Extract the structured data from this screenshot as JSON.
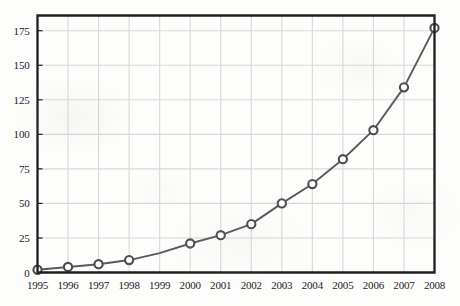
{
  "chart_data": {
    "type": "line",
    "title": "",
    "subtitle": "",
    "xlabel": "",
    "ylabel": "",
    "x": [
      1995,
      1996,
      1997,
      1998,
      1999,
      2000,
      2001,
      2002,
      2003,
      2004,
      2005,
      2006,
      2007,
      2008
    ],
    "categories": [
      "1995",
      "1996",
      "1997",
      "1998",
      "1999",
      "2000",
      "2001",
      "2002",
      "2003",
      "2004",
      "2005",
      "2006",
      "2007",
      "2008"
    ],
    "values": [
      2,
      4,
      6,
      9,
      14,
      21,
      27,
      35,
      50,
      64,
      82,
      103,
      134,
      177
    ],
    "markers_shown": [
      true,
      true,
      true,
      true,
      false,
      true,
      true,
      true,
      true,
      true,
      true,
      true,
      true,
      true
    ],
    "series": [
      {
        "name": "series-1",
        "values": [
          2,
          4,
          6,
          9,
          14,
          21,
          27,
          35,
          50,
          64,
          82,
          103,
          134,
          177
        ]
      }
    ],
    "xlim": [
      1995,
      2008
    ],
    "ylim": [
      0,
      186
    ],
    "ytick_labels": [
      "0",
      "25",
      "50",
      "75",
      "100",
      "125",
      "150",
      "175"
    ],
    "ytick_values": [
      0,
      25,
      50,
      75,
      100,
      125,
      150,
      175
    ],
    "xtick_labels": [
      "1995",
      "1996",
      "1997",
      "1998",
      "1999",
      "2000",
      "2001",
      "2002",
      "2003",
      "2004",
      "2005",
      "2006",
      "2007",
      "2008"
    ],
    "grid": true,
    "grid_axes": "both",
    "legend": false,
    "legend_position": "none",
    "annotations": []
  },
  "style": {
    "line_color": "#5a5a5a",
    "marker_fill": "#ffffff",
    "marker_edge": "#4d4d4d",
    "grid_color": "#d8d8d8",
    "frame_color": "#1f1f1f",
    "background_color": "#fdfdfc",
    "text_color": "#1b1b1b"
  }
}
